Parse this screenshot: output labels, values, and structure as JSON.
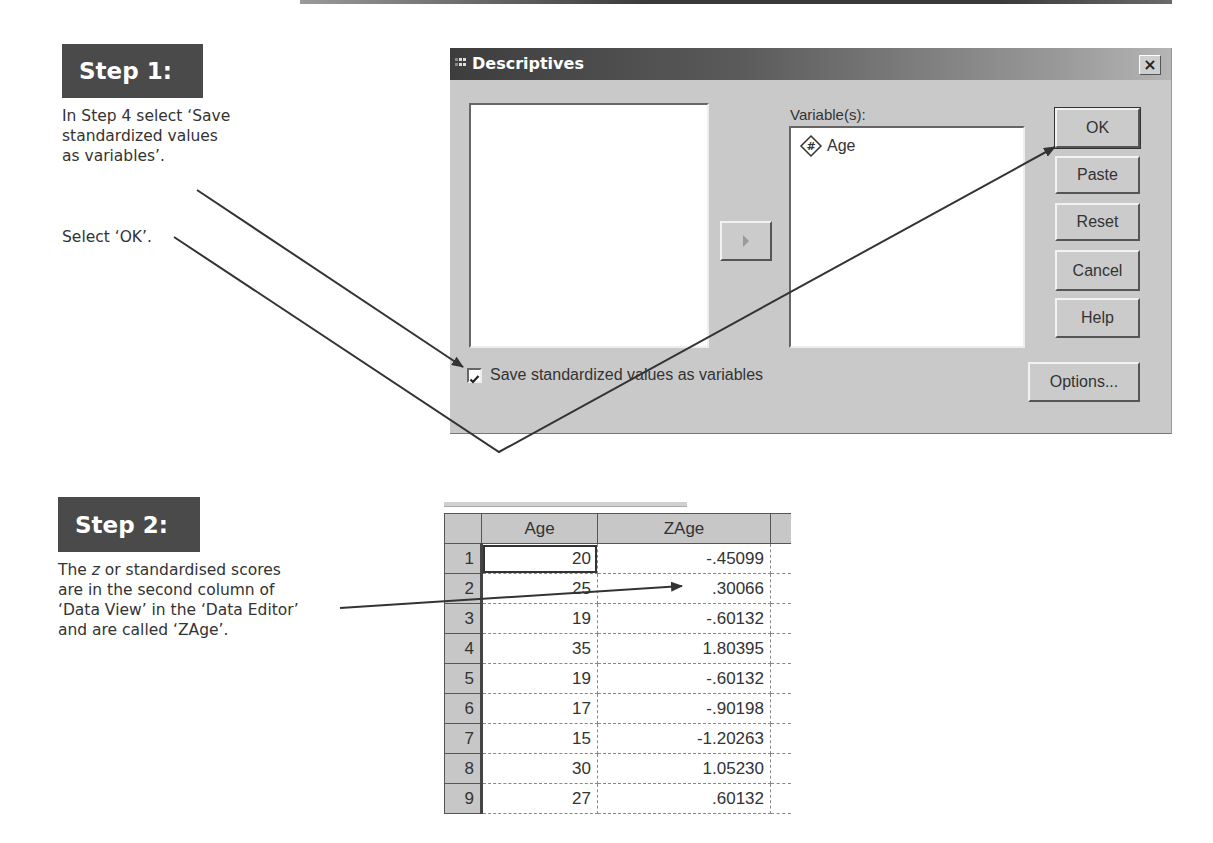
{
  "step1": {
    "badge": "Step 1:",
    "instruction_lines": [
      "In Step 4 select ‘Save",
      "standardized values",
      "as variables’."
    ],
    "instruction2": "Select ‘OK’."
  },
  "dialog": {
    "title": "Descriptives",
    "close_label": "×",
    "variables_label": "Variable(s):",
    "variables": [
      {
        "icon": "numeric-variable-icon",
        "name": "Age"
      }
    ],
    "buttons": {
      "ok": "OK",
      "paste": "Paste",
      "reset": "Reset",
      "cancel": "Cancel",
      "help": "Help",
      "options": "Options..."
    },
    "save_checkbox": {
      "label": "Save standardized values as variables",
      "checked": true
    }
  },
  "step2": {
    "badge": "Step 2:",
    "instruction_parts": {
      "pre": "The ",
      "italic": "z",
      "post": " or standardised scores"
    },
    "instruction_lines": [
      "are in the second column of",
      "‘Data View’ in the ‘Data Editor’",
      "and are called ‘ZAge’."
    ]
  },
  "data_table": {
    "columns": [
      "Age",
      "ZAge"
    ],
    "rows": [
      {
        "n": "1",
        "age": "20",
        "zage": "-.45099"
      },
      {
        "n": "2",
        "age": "25",
        "zage": ".30066"
      },
      {
        "n": "3",
        "age": "19",
        "zage": "-.60132"
      },
      {
        "n": "4",
        "age": "35",
        "zage": "1.80395"
      },
      {
        "n": "5",
        "age": "19",
        "zage": "-.60132"
      },
      {
        "n": "6",
        "age": "17",
        "zage": "-.90198"
      },
      {
        "n": "7",
        "age": "15",
        "zage": "-1.20263"
      },
      {
        "n": "8",
        "age": "30",
        "zage": "1.05230"
      },
      {
        "n": "9",
        "age": "27",
        "zage": ".60132"
      }
    ]
  }
}
